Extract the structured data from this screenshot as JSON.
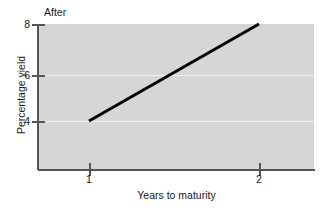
{
  "chart_data": {
    "type": "line",
    "title": "After",
    "xlabel": "Years to maturity",
    "ylabel": "Percentage yield",
    "x": [
      1,
      2
    ],
    "values": [
      4,
      8
    ],
    "series": [
      {
        "name": "yield curve",
        "points": [
          {
            "x": 1,
            "y": 4
          },
          {
            "x": 2,
            "y": 8
          }
        ],
        "color": "#000000"
      }
    ],
    "xlim": [
      0.7,
      2.3
    ],
    "ylim": [
      2.6,
      8.0
    ],
    "xticks": [
      1,
      2
    ],
    "xtick_labels": [
      "1",
      "2"
    ],
    "yticks": [
      4,
      6,
      8
    ],
    "ytick_labels": [
      "4",
      "6",
      "8"
    ],
    "gridlines": {
      "y": [
        4,
        6
      ],
      "color": "#f2f2f2",
      "x_grid": false
    },
    "legend": null,
    "plot_background": "#d6d6d6",
    "figure_background": "#ffffff",
    "axis_color": "#555555"
  }
}
